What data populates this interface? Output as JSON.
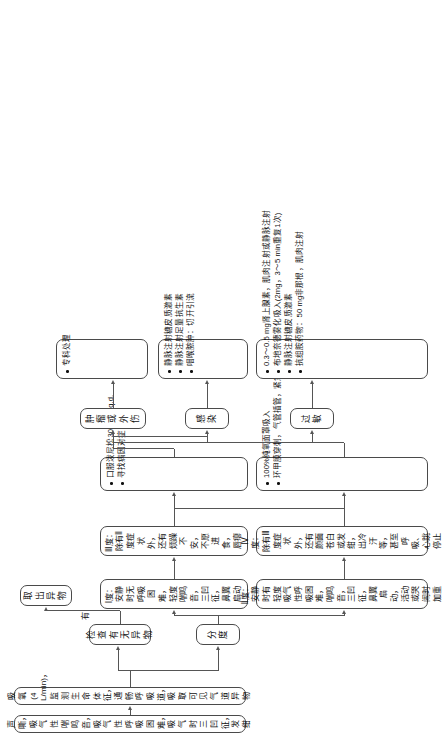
{
  "diagram": {
    "type": "flowchart",
    "orientation": "rotated-90",
    "nodes": {
      "symptoms": "声嘶，吸气性喘鸣音，吸气性呼吸困难，吸气时三凹征，发绀",
      "initial_care": "吸氧(4 L/min)，监测生命体征，通畅呼吸道，吸取可见气道异物",
      "check_fb": "检查有无异物",
      "remove_fb": "取出异物",
      "grading": "分度",
      "grade1": "Ⅰ度：安静时无呼吸困难，轻度喘鸣音，三凹征，鼻翼扇动",
      "grade2": "Ⅱ度：安静时有轻度吸气性呼吸困难，喘鸣音，三凹征，鼻翼扇动，活动或哭闹时加重",
      "grade3": "Ⅲ度：除有Ⅱ度症状外，还有烦躁不安，不愿进食，唇瘪",
      "grade4": "Ⅳ度：除有Ⅲ度症状外，还有颜面苍白或发绀，出冷汗等，甚至呼吸、心跳停止",
      "cause_allergy": "过敏",
      "cause_infection": "感染",
      "cause_tumor_trauma": "肿瘤或外伤",
      "specialist": "专科处理"
    },
    "edge_labels": {
      "has_fb": "有"
    },
    "treatment_mild": [
      "口服泼尼松30 mg，q.d.",
      "寻找病因对症治疗"
    ],
    "treatment_severe": [
      "100%纯氧面罩吸入",
      "环甲膜穿刺，气管插管，紧急气管切开"
    ],
    "treatment_allergy": [
      "0.3～0.5 mg肾上腺素，肌肉注射或静脉注射",
      "布地奈德雾化吸入(2mg，3～5 min重复1次)",
      "静脉注射糖皮质激素",
      "抗组胺药物：50 mg非那根，肌肉注射"
    ],
    "treatment_infection": [
      "静脉注射糖皮质激素",
      "静脉注射足量抗生素",
      "咽喉脓肿：切开引流"
    ],
    "treatment_specialist": [
      "专科处理"
    ]
  },
  "colors": {
    "border": "#4a4a4a",
    "line": "#555555",
    "text": "#111111",
    "background": "#ffffff"
  }
}
